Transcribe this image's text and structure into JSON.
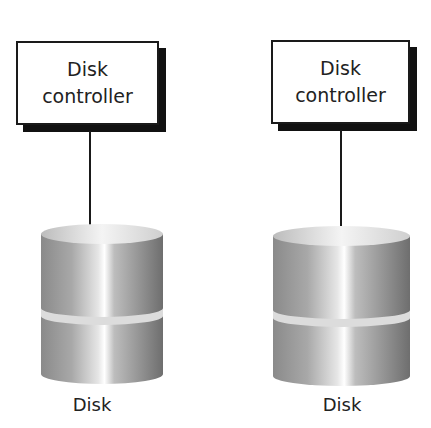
{
  "diagram": {
    "nodes": [
      {
        "controller": {
          "line1": "Disk",
          "line2": "controller"
        },
        "disk_label": "Disk"
      },
      {
        "controller": {
          "line1": "Disk",
          "line2": "controller"
        },
        "disk_label": "Disk"
      }
    ],
    "colors": {
      "stroke": "#1a1a1a",
      "shadow": "#111111",
      "disk_dark": "#7a7a7a",
      "disk_light": "#f2f2f2"
    }
  }
}
